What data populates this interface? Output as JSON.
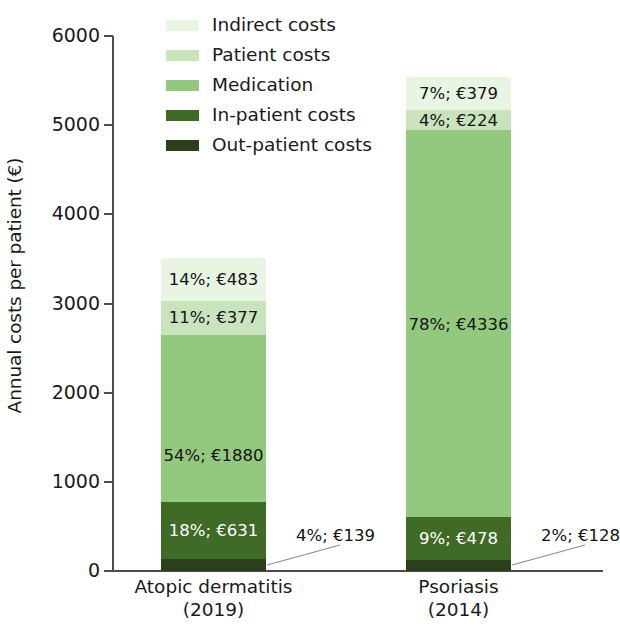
{
  "chart_data": {
    "type": "bar",
    "subtype": "stacked-bar-vertical-100-absolute",
    "title": "",
    "xlabel": "",
    "ylabel": "Annual costs per patient (€)",
    "ylim": [
      0,
      6000
    ],
    "ytick_values": [
      0,
      1000,
      2000,
      3000,
      4000,
      5000,
      6000
    ],
    "ytick_labels": [
      "0",
      "1000",
      "2000",
      "3000",
      "4000",
      "5000",
      "6000"
    ],
    "grid": false,
    "legend_position": "top-left",
    "categories": [
      "Atopic dermatitis",
      "Psoriasis"
    ],
    "category_years": [
      "(2019)",
      "(2014)"
    ],
    "category_labels": [
      "Atopic dermatitis\n(2019)",
      "Psoriasis\n(2014)"
    ],
    "stack_order_bottom_to_top": [
      "Out-patient costs",
      "In-patient costs",
      "Medication",
      "Patient costs",
      "Indirect costs"
    ],
    "totals": [
      3510,
      5545
    ],
    "series": [
      {
        "name": "Out-patient costs",
        "color": "#2c3f1d",
        "values": [
          139,
          128
        ],
        "percents": [
          4,
          2
        ],
        "labels": [
          "4%; €139",
          "2%; €128"
        ],
        "label_placement": [
          "callout",
          "callout"
        ]
      },
      {
        "name": "In-patient costs",
        "color": "#3f6b26",
        "values": [
          631,
          478
        ],
        "percents": [
          18,
          9
        ],
        "labels": [
          "18%; €631",
          "9%; €478"
        ],
        "label_placement": [
          "inside",
          "inside"
        ]
      },
      {
        "name": "Medication",
        "color": "#93c87f",
        "values": [
          1880,
          4336
        ],
        "percents": [
          54,
          78
        ],
        "labels": [
          "54%; €1880",
          "78%; €4336"
        ],
        "label_placement": [
          "inside",
          "inside"
        ]
      },
      {
        "name": "Patient costs",
        "color": "#c9e4bd",
        "values": [
          377,
          224
        ],
        "percents": [
          11,
          4
        ],
        "labels": [
          "11%; €377",
          "4%; €224"
        ],
        "label_placement": [
          "inside",
          "inside"
        ]
      },
      {
        "name": "Indirect costs",
        "color": "#e8f5e3",
        "values": [
          483,
          379
        ],
        "percents": [
          14,
          7
        ],
        "labels": [
          "14%; €483",
          "7%; €379"
        ],
        "label_placement": [
          "inside",
          "inside"
        ]
      }
    ]
  },
  "legend": {
    "items": [
      {
        "label": "Indirect costs",
        "color": "#e8f5e3"
      },
      {
        "label": "Patient costs",
        "color": "#c9e4bd"
      },
      {
        "label": "Medication",
        "color": "#93c87f"
      },
      {
        "label": "In-patient costs",
        "color": "#3f6b26"
      },
      {
        "label": "Out-patient costs",
        "color": "#2c3f1d"
      }
    ]
  },
  "axes": {
    "y_title": "Annual costs per patient (€)",
    "axis_color": "#4d4d4d"
  },
  "colors": {
    "indirect_costs": "#e8f5e3",
    "patient_costs": "#c9e4bd",
    "medication": "#93c87f",
    "in_patient_costs": "#3f6b26",
    "out_patient_costs": "#2c3f1d",
    "axis": "#4d4d4d",
    "text": "#1a1a1a",
    "background": "#ffffff"
  }
}
